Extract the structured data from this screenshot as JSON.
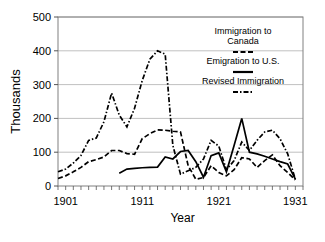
{
  "chart_data": {
    "type": "line",
    "title": "",
    "xlabel": "Year",
    "ylabel": "Thousands",
    "xlim": [
      1900,
      1932
    ],
    "ylim": [
      0,
      500
    ],
    "yticks": [
      0,
      100,
      200,
      300,
      400,
      500
    ],
    "ytick_labels": [
      "0",
      "100",
      "200",
      "300",
      "400",
      "500"
    ],
    "xticks": [
      1901,
      1911,
      1921,
      1931
    ],
    "xtick_labels": [
      "1901",
      "1911",
      "1921",
      "1931"
    ],
    "minor_xtick_interval": 1,
    "grid": "horizontal",
    "legend_position": "upper-right-inside",
    "series": [
      {
        "name": "Immigration to Canada",
        "style": "dashed",
        "color": "#000000",
        "x": [
          1900,
          1901,
          1902,
          1903,
          1904,
          1905,
          1906,
          1907,
          1908,
          1909,
          1910,
          1911,
          1912,
          1913,
          1914,
          1915,
          1916,
          1917,
          1918,
          1919,
          1920,
          1921,
          1922,
          1923,
          1924,
          1925,
          1926,
          1927,
          1928,
          1929,
          1930,
          1931
        ],
        "values": [
          22,
          30,
          42,
          55,
          72,
          78,
          86,
          105,
          105,
          96,
          94,
          140,
          155,
          166,
          165,
          162,
          160,
          60,
          20,
          25,
          60,
          40,
          30,
          48,
          84,
          80,
          55,
          75,
          92,
          60,
          40,
          18
        ]
      },
      {
        "name": "Emigration to U.S.",
        "style": "solid",
        "color": "#000000",
        "x": [
          1908,
          1909,
          1910,
          1911,
          1912,
          1913,
          1914,
          1915,
          1916,
          1917,
          1918,
          1919,
          1920,
          1921,
          1922,
          1923,
          1924,
          1925,
          1926,
          1927,
          1928,
          1929,
          1930,
          1931
        ],
        "values": [
          38,
          50,
          52,
          54,
          55,
          56,
          86,
          80,
          102,
          105,
          72,
          26,
          90,
          98,
          42,
          120,
          200,
          100,
          95,
          88,
          80,
          72,
          65,
          20
        ]
      },
      {
        "name": "Revised Immigration",
        "style": "dash-dot",
        "color": "#000000",
        "x": [
          1900,
          1901,
          1902,
          1903,
          1904,
          1905,
          1906,
          1907,
          1908,
          1909,
          1910,
          1911,
          1912,
          1913,
          1914,
          1915,
          1916,
          1917,
          1918,
          1919,
          1920,
          1921,
          1922,
          1923,
          1924,
          1925,
          1926,
          1927,
          1928,
          1929,
          1930,
          1931
        ],
        "values": [
          42,
          50,
          68,
          90,
          135,
          142,
          190,
          275,
          210,
          175,
          230,
          312,
          375,
          400,
          390,
          120,
          35,
          45,
          55,
          80,
          135,
          118,
          48,
          75,
          130,
          105,
          135,
          160,
          165,
          140,
          95,
          20
        ]
      }
    ],
    "annotations": []
  },
  "legend": {
    "entries": [
      {
        "label_line1": "Immigration to",
        "label_line2": "Canada",
        "swatch": "dashed"
      },
      {
        "label_line1": "Emigration to U.S.",
        "label_line2": "",
        "swatch": "solid"
      },
      {
        "label_line1": "Revised Immigration",
        "label_line2": "",
        "swatch": "dash-dot"
      }
    ]
  }
}
